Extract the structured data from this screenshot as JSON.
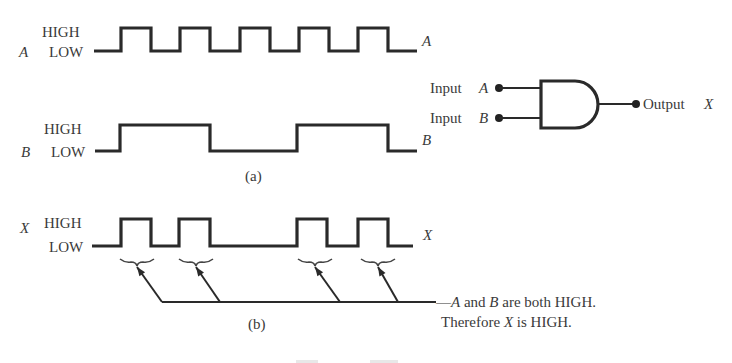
{
  "diagram": {
    "colors": {
      "ink": "#2a2a2a",
      "text": "#3a3a3a",
      "background": "#ffffff"
    },
    "level_labels": {
      "high": "HIGH",
      "low": "LOW"
    },
    "signals": [
      {
        "id": "A",
        "name": "A",
        "right_label": "A",
        "high_y": 28,
        "low_y": 51,
        "start_x": 94,
        "end_x": 417,
        "transitions": [
          {
            "x": 121,
            "to": "HIGH"
          },
          {
            "x": 151,
            "to": "LOW"
          },
          {
            "x": 180,
            "to": "HIGH"
          },
          {
            "x": 210,
            "to": "LOW"
          },
          {
            "x": 240,
            "to": "HIGH"
          },
          {
            "x": 270,
            "to": "LOW"
          },
          {
            "x": 299,
            "to": "HIGH"
          },
          {
            "x": 329,
            "to": "LOW"
          },
          {
            "x": 358,
            "to": "HIGH"
          },
          {
            "x": 388,
            "to": "LOW"
          }
        ]
      },
      {
        "id": "B",
        "name": "B",
        "right_label": "B",
        "high_y": 125,
        "low_y": 151,
        "start_x": 95,
        "end_x": 417,
        "transitions": [
          {
            "x": 120,
            "to": "HIGH"
          },
          {
            "x": 210,
            "to": "LOW"
          },
          {
            "x": 297,
            "to": "HIGH"
          },
          {
            "x": 388,
            "to": "LOW"
          }
        ]
      },
      {
        "id": "X",
        "name": "X",
        "right_label": "X",
        "high_y": 219,
        "low_y": 246,
        "start_x": 92,
        "end_x": 413,
        "transitions": [
          {
            "x": 121,
            "to": "HIGH"
          },
          {
            "x": 151,
            "to": "LOW"
          },
          {
            "x": 179,
            "to": "HIGH"
          },
          {
            "x": 210,
            "to": "LOW"
          },
          {
            "x": 297,
            "to": "HIGH"
          },
          {
            "x": 327,
            "to": "LOW"
          },
          {
            "x": 358,
            "to": "HIGH"
          },
          {
            "x": 388,
            "to": "LOW"
          }
        ]
      }
    ],
    "part_labels": {
      "a": "(a)",
      "b": "(b)"
    },
    "gate": {
      "type": "AND",
      "input_a_label": "Input",
      "input_a_var": "A",
      "input_b_label": "Input",
      "input_b_var": "B",
      "output_label": "Output",
      "output_var": "X"
    },
    "annotation": {
      "line1_var_a": "A",
      "line1_mid": " and ",
      "line1_var_b": "B",
      "line1_end": " are both HIGH.",
      "line2_start": "Therefore ",
      "line2_var": "X",
      "line2_end": " is HIGH.",
      "brace_centers_x": [
        137,
        196,
        315,
        378
      ],
      "arrow_base_x": [
        162,
        220,
        340,
        398
      ],
      "brace_y": 262,
      "baseline_y": 302
    }
  }
}
